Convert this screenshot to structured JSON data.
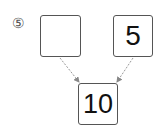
{
  "problem": {
    "number_label": "⑤",
    "top_left": {
      "value": ""
    },
    "top_right": {
      "value": "5"
    },
    "bottom": {
      "value": "10"
    }
  },
  "colors": {
    "box_border": "#555555",
    "arrow": "#999999",
    "text": "#111111"
  }
}
